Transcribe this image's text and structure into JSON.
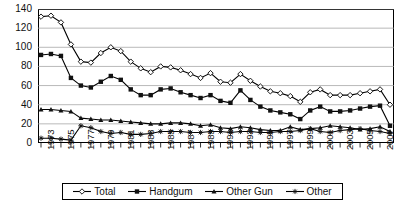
{
  "chart_data": {
    "type": "line",
    "title": "",
    "xlabel": "",
    "ylabel": "",
    "ylim": [
      0,
      140
    ],
    "ytick_step": 20,
    "yticks": [
      140,
      120,
      100,
      80,
      60,
      40,
      20,
      0
    ],
    "grid": true,
    "grid_axis": "y",
    "legend_position": "bottom",
    "x": [
      1973,
      1974,
      1975,
      1976,
      1977,
      1978,
      1979,
      1980,
      1981,
      1982,
      1983,
      1984,
      1985,
      1986,
      1987,
      1988,
      1989,
      1990,
      1991,
      1992,
      1993,
      1994,
      1995,
      1996,
      1997,
      1998,
      1999,
      2000,
      2001,
      2002,
      2003,
      2004,
      2005,
      2006,
      2007,
      2008
    ],
    "xtick_labels": [
      "1973",
      "",
      "1975",
      "",
      "1977",
      "",
      "1979",
      "",
      "1981",
      "",
      "1983",
      "",
      "1985",
      "",
      "1987",
      "",
      "1989",
      "",
      "1991",
      "",
      "1993",
      "",
      "1995",
      "",
      "1997",
      "",
      "1999",
      "",
      "2001",
      "",
      "2003",
      "",
      "2005",
      "",
      "2007",
      ""
    ],
    "series": [
      {
        "name": "Total",
        "marker": "open-diamond",
        "color": "#000000",
        "values": [
          132,
          133,
          126,
          103,
          85,
          84,
          94,
          100,
          96,
          85,
          78,
          74,
          80,
          79,
          76,
          72,
          68,
          73,
          64,
          63,
          72,
          65,
          59,
          54,
          52,
          49,
          43,
          53,
          56,
          50,
          50,
          50,
          52,
          54,
          56,
          40
        ]
      },
      {
        "name": "Handgum",
        "marker": "filled-square",
        "color": "#000000",
        "values": [
          92,
          93,
          91,
          68,
          60,
          58,
          64,
          70,
          66,
          56,
          50,
          50,
          56,
          57,
          53,
          50,
          47,
          50,
          44,
          42,
          55,
          45,
          38,
          34,
          32,
          30,
          25,
          34,
          38,
          33,
          33,
          34,
          36,
          38,
          39,
          18
        ]
      },
      {
        "name": "Other Gun",
        "marker": "filled-triangle",
        "color": "#000000",
        "values": [
          35,
          35,
          34,
          33,
          26,
          25,
          24,
          24,
          23,
          22,
          21,
          20,
          20,
          21,
          21,
          20,
          18,
          19,
          16,
          15,
          17,
          16,
          14,
          13,
          13,
          17,
          14,
          15,
          16,
          18,
          17,
          16,
          14,
          15,
          17,
          12
        ]
      },
      {
        "name": "Other",
        "marker": "asterisk",
        "color": "#000000",
        "values": [
          5,
          5,
          4,
          3,
          18,
          16,
          12,
          10,
          11,
          9,
          9,
          10,
          12,
          12,
          12,
          11,
          11,
          12,
          12,
          11,
          12,
          12,
          11,
          11,
          12,
          12,
          13,
          15,
          12,
          11,
          13,
          14,
          15,
          13,
          12,
          10
        ]
      }
    ]
  },
  "legend": {
    "items": [
      {
        "label": "Total"
      },
      {
        "label": "Handgum"
      },
      {
        "label": "Other Gun"
      },
      {
        "label": "Other"
      }
    ]
  }
}
